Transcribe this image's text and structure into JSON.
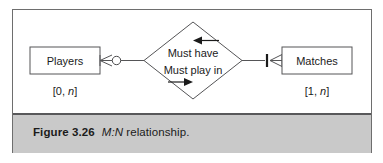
{
  "figure": {
    "caption_number": "Figure 3.26",
    "caption_emphasis": "M:N",
    "caption_rest": "relationship.",
    "caption_full": "Figure 3.26 M:N relationship."
  },
  "diagram": {
    "type": "entity-relationship",
    "notation": "crow's foot",
    "entities": [
      {
        "id": "players",
        "label": "Players",
        "cardinality": "[0, n]",
        "cardinality_min": "0",
        "cardinality_max": "n",
        "side": "left",
        "connector": {
          "symbols": [
            "crows-foot",
            "circle"
          ],
          "meaning": "zero or many"
        }
      },
      {
        "id": "matches",
        "label": "Matches",
        "cardinality": "[1, n]",
        "cardinality_min": "1",
        "cardinality_max": "n",
        "side": "right",
        "connector": {
          "symbols": [
            "bar",
            "crows-foot"
          ],
          "meaning": "one or many"
        }
      }
    ],
    "relationship": {
      "shape": "diamond",
      "line_top": "Must have",
      "line_bottom": "Must play in",
      "arrow_top_direction": "left",
      "arrow_bottom_direction": "right"
    },
    "colors": {
      "frame_border": "#6e6e6e",
      "caption_background": "#c9c9c9",
      "caption_rule": "#58585a",
      "shape_stroke": "#555557",
      "text": "#1b1b1b",
      "panel_background": "#ffffff"
    }
  }
}
